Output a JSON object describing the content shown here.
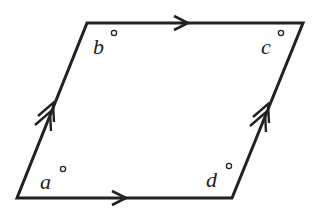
{
  "diagram": {
    "shape": "parallelogram",
    "vertices": {
      "bottom_left": [
        17,
        198
      ],
      "top_left": [
        87,
        23
      ],
      "top_right": [
        303,
        23
      ],
      "bottom_right": [
        232,
        198
      ]
    },
    "angles": [
      {
        "id": "a",
        "label": "a",
        "vertex": "bottom_left",
        "unit": "°"
      },
      {
        "id": "b",
        "label": "b",
        "vertex": "top_left",
        "unit": "°"
      },
      {
        "id": "c",
        "label": "c",
        "vertex": "top_right",
        "unit": "°"
      },
      {
        "id": "d",
        "label": "d",
        "vertex": "bottom_right",
        "unit": "°"
      }
    ],
    "markings": {
      "horizontal_sides": "single arrow (parallel)",
      "slanted_sides": "double arrow (parallel)"
    },
    "stroke_color": "#222222"
  }
}
